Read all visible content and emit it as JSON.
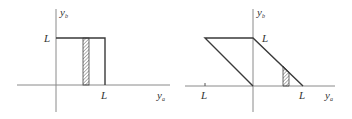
{
  "panels": [
    {
      "id": "left",
      "description": "Square region in the first quadrant with a vertical hatched strip",
      "y_axis_label": {
        "main": "y",
        "sub": "b"
      },
      "x_axis_label": {
        "main": "y",
        "sub": "a"
      },
      "y_tick_label": "L",
      "x_tick_label": "L"
    },
    {
      "id": "right",
      "description": "Parallelogram spanning from -L to L with a hatched strip under the right diagonal",
      "y_axis_label": {
        "main": "y",
        "sub": "b"
      },
      "x_axis_label": {
        "main": "y",
        "sub": "a"
      },
      "y_tick_label": "L",
      "x_tick_label_pos": "L",
      "x_tick_label_neg": "L"
    }
  ],
  "colors": {
    "axis": "#8a8a8a",
    "shape": "#3a3a3a",
    "hatch": "#555555"
  }
}
